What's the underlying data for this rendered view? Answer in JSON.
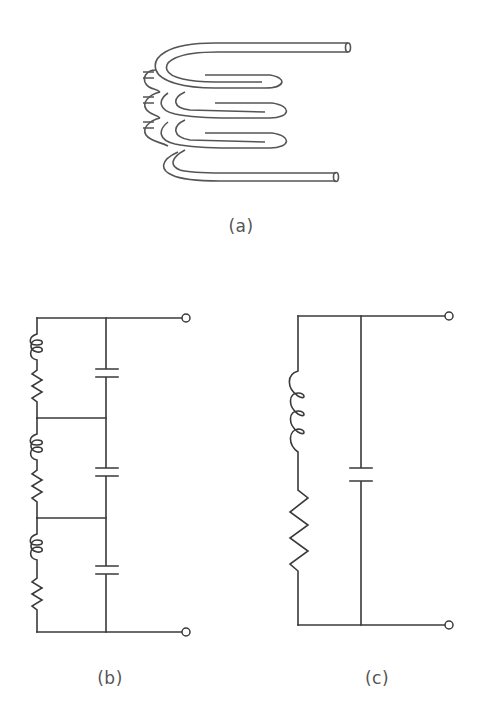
{
  "figure": {
    "panels": [
      {
        "id": "a",
        "label": "(a)",
        "description": "Helical coil of tubing with inter-turn capacitances",
        "elements": [
          "coil",
          "distributed-capacitance"
        ]
      },
      {
        "id": "b",
        "label": "(b)",
        "description": "Distributed-parameter equivalent: three series L-R sections with shunt capacitances",
        "sections": 3,
        "terminals": 2
      },
      {
        "id": "c",
        "label": "(c)",
        "description": "Lumped equivalent: series inductor and resistor in parallel with a capacitor",
        "elements": [
          "inductor",
          "resistor",
          "capacitor"
        ],
        "terminals": 2
      }
    ],
    "colors": {
      "line": "#3a3a3a",
      "text": "#555555",
      "background": "#ffffff"
    }
  }
}
